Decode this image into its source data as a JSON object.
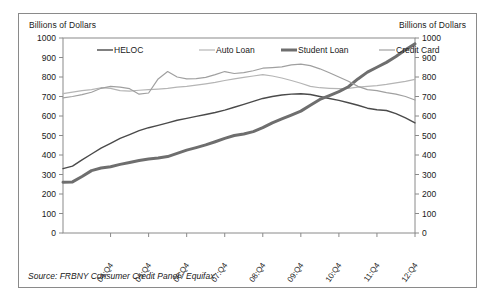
{
  "figure": {
    "left_axis_title": "Billions of Dollars",
    "right_axis_title": "Billions of Dollars",
    "source_note": "Source: FRBNY Consumer Credit Panel / Equifax"
  },
  "chart_data": {
    "type": "line",
    "title": "",
    "xlabel": "",
    "ylabel": "Billions of Dollars",
    "ylim": [
      0,
      1000
    ],
    "ytick_labels": [
      "1000",
      "900",
      "800",
      "700",
      "600",
      "500",
      "400",
      "300",
      "200",
      "100",
      "0"
    ],
    "ytick_values": [
      1000,
      900,
      800,
      700,
      600,
      500,
      400,
      300,
      200,
      100,
      0
    ],
    "xtick_labels": [
      "04:Q4",
      "05:Q4",
      "06:Q4",
      "07:Q4",
      "08:Q4",
      "09:Q4",
      "10:Q4",
      "11:Q4",
      "12:Q4"
    ],
    "xtick_indices": [
      5,
      9,
      13,
      17,
      21,
      25,
      29,
      33,
      37
    ],
    "x": [
      "03:Q3",
      "03:Q4",
      "04:Q1",
      "04:Q2",
      "04:Q3",
      "04:Q4",
      "05:Q1",
      "05:Q2",
      "05:Q3",
      "05:Q4",
      "06:Q1",
      "06:Q2",
      "06:Q3",
      "06:Q4",
      "07:Q1",
      "07:Q2",
      "07:Q3",
      "07:Q4",
      "08:Q1",
      "08:Q2",
      "08:Q3",
      "08:Q4",
      "09:Q1",
      "09:Q2",
      "09:Q3",
      "09:Q4",
      "10:Q1",
      "10:Q2",
      "10:Q3",
      "10:Q4",
      "11:Q1",
      "11:Q2",
      "11:Q3",
      "11:Q4",
      "12:Q1",
      "12:Q2",
      "12:Q3",
      "12:Q4"
    ],
    "grid": false,
    "legend_position": "top-inside",
    "series": [
      {
        "name": "HELOC",
        "color": "#4a4a4a",
        "width": 1.4,
        "values": [
          330,
          343,
          375,
          405,
          435,
          460,
          485,
          505,
          525,
          540,
          552,
          565,
          578,
          588,
          598,
          608,
          618,
          630,
          645,
          660,
          675,
          690,
          700,
          708,
          712,
          714,
          710,
          700,
          690,
          680,
          668,
          655,
          640,
          632,
          628,
          612,
          590,
          565
        ]
      },
      {
        "name": "Auto Loan",
        "color": "#b5b5b5",
        "width": 1.2,
        "values": [
          715,
          722,
          730,
          735,
          745,
          742,
          730,
          728,
          732,
          735,
          738,
          742,
          748,
          752,
          758,
          765,
          772,
          782,
          790,
          798,
          805,
          812,
          805,
          795,
          782,
          768,
          752,
          745,
          742,
          740,
          742,
          748,
          752,
          756,
          762,
          770,
          778,
          788
        ]
      },
      {
        "name": "Student Loan",
        "color": "#6e6e6e",
        "width": 3.0,
        "values": [
          260,
          262,
          290,
          320,
          333,
          340,
          352,
          362,
          372,
          380,
          385,
          392,
          408,
          425,
          438,
          452,
          468,
          485,
          500,
          508,
          520,
          540,
          565,
          585,
          605,
          625,
          655,
          685,
          705,
          725,
          750,
          790,
          825,
          850,
          875,
          905,
          940,
          970
        ]
      },
      {
        "name": "Credit Card",
        "color": "#a0a0a0",
        "width": 1.2,
        "values": [
          693,
          700,
          710,
          722,
          742,
          752,
          748,
          740,
          712,
          718,
          790,
          828,
          800,
          790,
          792,
          798,
          812,
          828,
          818,
          822,
          832,
          845,
          848,
          852,
          862,
          866,
          858,
          842,
          822,
          800,
          778,
          752,
          735,
          730,
          720,
          712,
          700,
          682
        ]
      }
    ]
  },
  "legend": {
    "items": [
      {
        "label": "HELOC"
      },
      {
        "label": "Auto Loan"
      },
      {
        "label": "Student Loan"
      },
      {
        "label": "Credit Card"
      }
    ]
  }
}
